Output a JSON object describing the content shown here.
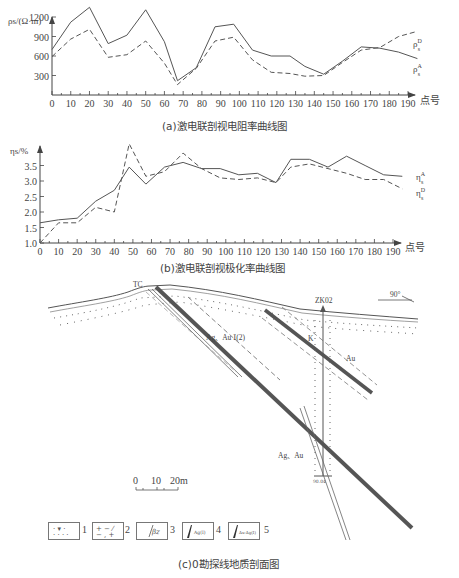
{
  "chart_data": [
    {
      "type": "line",
      "title": "(a)激电联剖视电阻率曲线图",
      "xlabel": "点号",
      "ylabel": "ρs/(Ω·m)",
      "x": [
        0,
        10,
        20,
        30,
        40,
        50,
        60,
        67,
        77,
        87,
        97,
        107,
        117,
        127,
        135,
        145,
        155,
        165,
        175,
        185,
        195
      ],
      "xticks": [
        0,
        10,
        20,
        30,
        40,
        50,
        60,
        70,
        80,
        90,
        100,
        110,
        120,
        130,
        140,
        150,
        160,
        170,
        180,
        190
      ],
      "yticks": [
        300,
        600,
        900,
        1200
      ],
      "ylim": [
        0,
        1400
      ],
      "series": [
        {
          "name": "ρsA",
          "style": "solid",
          "values": [
            700,
            1120,
            1350,
            790,
            920,
            1310,
            820,
            220,
            420,
            1050,
            1090,
            690,
            600,
            600,
            440,
            320,
            520,
            740,
            720,
            660,
            560
          ]
        },
        {
          "name": "ρsB",
          "style": "dashed",
          "values": [
            590,
            860,
            1010,
            580,
            620,
            830,
            490,
            160,
            410,
            830,
            890,
            540,
            350,
            330,
            290,
            300,
            500,
            690,
            730,
            900,
            980
          ]
        }
      ],
      "legend": [
        "ρsA",
        "ρsB"
      ],
      "grid": false
    },
    {
      "type": "line",
      "title": "(b)激电联剖视极化率曲线图",
      "xlabel": "点号",
      "ylabel": "ηs/%",
      "x": [
        0,
        10,
        20,
        30,
        40,
        48,
        57,
        67,
        77,
        87,
        97,
        107,
        117,
        127,
        135,
        145,
        155,
        165,
        175,
        185,
        195
      ],
      "xticks": [
        0,
        10,
        20,
        30,
        40,
        50,
        60,
        70,
        80,
        90,
        100,
        110,
        120,
        130,
        140,
        150,
        160,
        170,
        180,
        190
      ],
      "yticks": [
        1.0,
        1.5,
        2.0,
        2.5,
        3.0,
        3.5
      ],
      "ylim": [
        1.0,
        4.0
      ],
      "series": [
        {
          "name": "ηsA",
          "style": "solid",
          "values": [
            1.65,
            1.75,
            1.8,
            2.35,
            2.7,
            3.45,
            2.9,
            3.45,
            3.6,
            3.4,
            3.4,
            3.2,
            3.25,
            2.95,
            3.7,
            3.7,
            3.45,
            3.8,
            3.5,
            3.2,
            3.15
          ]
        },
        {
          "name": "ηsB",
          "style": "dashed",
          "values": [
            1.0,
            1.65,
            1.65,
            2.15,
            2.0,
            4.2,
            3.15,
            3.3,
            3.9,
            3.4,
            3.1,
            3.05,
            3.1,
            2.95,
            3.45,
            3.55,
            3.4,
            3.25,
            3.05,
            3.05,
            2.75
          ]
        }
      ],
      "legend": [
        "ηsA",
        "ηsB"
      ],
      "grid": false
    }
  ],
  "chart_a": {
    "ylabel": "ρs/(Ω·m)",
    "xunit": "点号",
    "yticks": [
      "1200",
      "900",
      "600",
      "300"
    ],
    "xticks": [
      "0",
      "10",
      "20",
      "30",
      "40",
      "50",
      "60",
      "70",
      "80",
      "90",
      "100",
      "110",
      "120",
      "130",
      "140",
      "150",
      "160",
      "170",
      "180",
      "190"
    ],
    "legend_a": "ρ",
    "legend_a_sup": "D",
    "legend_a_sub": "s",
    "legend_b_sup": "A",
    "caption": "(a)激电联剖视电阻率曲线图"
  },
  "chart_b": {
    "ylabel": "ηs/%",
    "xunit": "点号",
    "yticks": [
      "3.5",
      "3.0",
      "2.5",
      "2.0",
      "1.5",
      "1.0"
    ],
    "xticks": [
      "0",
      "10",
      "20",
      "30",
      "40",
      "50",
      "60",
      "70",
      "80",
      "90",
      "100",
      "110",
      "120",
      "130",
      "140",
      "150",
      "160",
      "170",
      "180",
      "190"
    ],
    "legend_a_sup": "A",
    "legend_b_sup": "D",
    "caption": "(b)激电联剖视极化率曲线图"
  },
  "section": {
    "caption": "(c)0勘探线地质剖面图",
    "labels": {
      "tc": "TC",
      "zk": "ZK02",
      "direction": "90°",
      "vein1": "Ag、Au Ⅰ(2)",
      "vein2": "Au",
      "vein3": "Ag、Au",
      "vein_k": "K",
      "hole_depth": "90.04"
    },
    "scale": {
      "ticks": [
        "0",
        "10",
        "20m"
      ]
    },
    "legend": [
      {
        "num": "1",
        "symbol": "dotted-triangle"
      },
      {
        "num": "2",
        "symbol": "cross-dash"
      },
      {
        "num": "3",
        "symbol": "βz",
        "text": "βz"
      },
      {
        "num": "4",
        "symbol": "vein-ag",
        "text": "Ag(Ⅰ)"
      },
      {
        "num": "5",
        "symbol": "vein-auag",
        "text": "Au-Ag(Ⅰ)"
      }
    ]
  }
}
